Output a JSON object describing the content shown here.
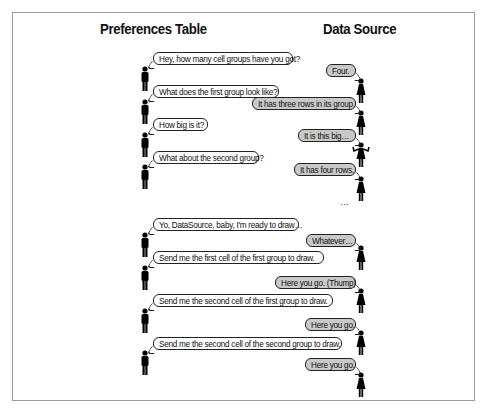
{
  "diagram": {
    "columns": {
      "left_title": "Preferences Table",
      "right_title": "Data Source"
    },
    "phase_one": {
      "exchanges": [
        {
          "speaker": "preferences-table",
          "text": "Hey, how many cell groups have you got?"
        },
        {
          "speaker": "data-source",
          "text": "Four."
        },
        {
          "speaker": "preferences-table",
          "text": "What does the first group look like?"
        },
        {
          "speaker": "data-source",
          "text": "It has three rows in its group."
        },
        {
          "speaker": "preferences-table",
          "text": "How big is it?"
        },
        {
          "speaker": "data-source",
          "text": "It is this big…"
        },
        {
          "speaker": "preferences-table",
          "text": "What about the second group?"
        },
        {
          "speaker": "data-source",
          "text": "It has four rows."
        }
      ],
      "continuation": "…"
    },
    "phase_two": {
      "exchanges": [
        {
          "speaker": "preferences-table",
          "text": "Yo, DataSource, baby, I'm ready to draw…"
        },
        {
          "speaker": "data-source",
          "text": "Whatever…"
        },
        {
          "speaker": "preferences-table",
          "text": "Send me the first cell of the first group to draw."
        },
        {
          "speaker": "data-source",
          "text": "Here you go. (Thump)"
        },
        {
          "speaker": "preferences-table",
          "text": "Send me the second cell of the first group to draw."
        },
        {
          "speaker": "data-source",
          "text": "Here you go."
        },
        {
          "speaker": "preferences-table",
          "text": "Send me the second cell of the second group to draw."
        },
        {
          "speaker": "data-source",
          "text": "Here you go."
        }
      ]
    },
    "colors": {
      "left_bubble_fill": "#ffffff",
      "right_bubble_fill": "#c9c9c9",
      "outline": "#222222",
      "figure": "#000000",
      "frame_border": "#9a9a9a"
    }
  }
}
